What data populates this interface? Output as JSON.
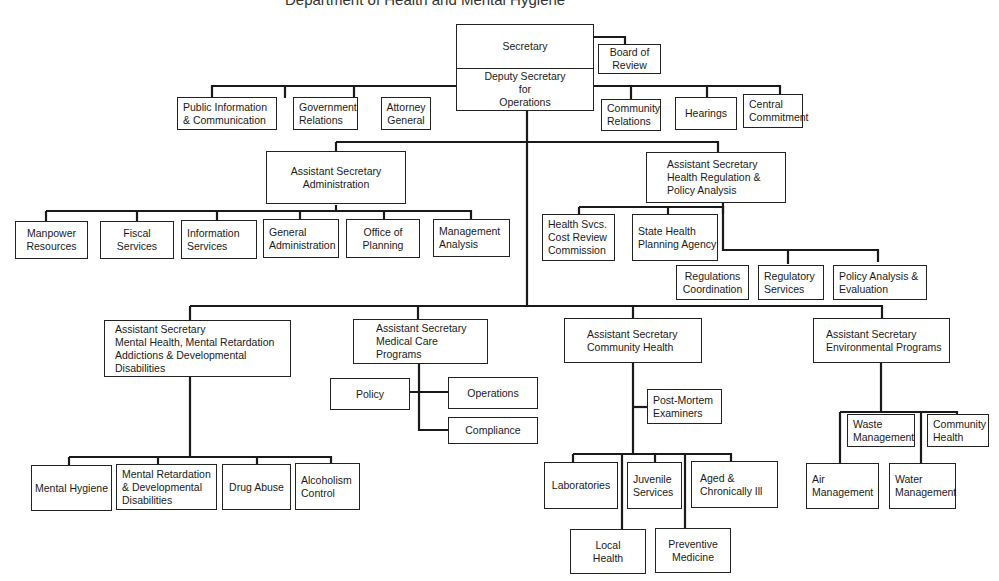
{
  "diagram": {
    "type": "org-chart",
    "top": {
      "secretary": "Secretary",
      "deputy": [
        "Deputy Secretary",
        "for",
        "Operations"
      ],
      "board_of_review": [
        "Board of",
        "Review"
      ]
    },
    "staff_left": [
      [
        "Public Information",
        "& Communication"
      ],
      [
        "Government",
        "Relations"
      ],
      [
        "Attorney",
        "General"
      ]
    ],
    "staff_right": [
      [
        "Community",
        "Relations"
      ],
      [
        "Hearings"
      ],
      [
        "Central",
        "Commitment"
      ]
    ],
    "administration": {
      "head": [
        "Assistant Secretary",
        "Administration"
      ],
      "units": [
        [
          "Manpower",
          "Resources"
        ],
        [
          "Fiscal",
          "Services"
        ],
        [
          "Information",
          "Services"
        ],
        [
          "General",
          "Administration"
        ],
        [
          "Office of",
          "Planning"
        ],
        [
          "Management",
          "Analysis"
        ]
      ]
    },
    "health_regulation": {
      "head": [
        "Assistant Secretary",
        "Health Regulation &",
        "Policy Analysis"
      ],
      "upper_units": [
        [
          "Health Svcs.",
          "Cost Review",
          "Commission"
        ],
        [
          "State Health",
          "Planning Agency"
        ]
      ],
      "lower_units": [
        [
          "Regulations",
          "Coordination"
        ],
        [
          "Regulatory",
          "Services"
        ],
        [
          "Policy Analysis &",
          "Evaluation"
        ]
      ]
    },
    "mental_health": {
      "head": [
        "Assistant Secretary",
        "Mental Health, Mental Retardation",
        "Addictions & Developmental",
        "Disabilities"
      ],
      "units": [
        [
          "Mental Hygiene"
        ],
        [
          "Mental Retardation",
          "& Developmental",
          "Disabilities"
        ],
        [
          "Drug Abuse"
        ],
        [
          "Alcoholism",
          "Control"
        ]
      ]
    },
    "medical_care": {
      "head": [
        "Assistant Secretary",
        "Medical Care",
        "Programs"
      ],
      "units": [
        [
          "Policy"
        ],
        [
          "Operations"
        ],
        [
          "Compliance"
        ]
      ]
    },
    "community_health": {
      "head": [
        "Assistant Secretary",
        "Community Health"
      ],
      "side_unit": [
        "Post-Mortem",
        "Examiners"
      ],
      "units_row1": [
        [
          "Laboratories"
        ],
        [
          "Juvenile",
          "Services"
        ],
        [
          "Aged &",
          "Chronically Ill"
        ]
      ],
      "units_row2": [
        [
          "Local",
          "Health"
        ],
        [
          "Preventive",
          "Medicine"
        ]
      ]
    },
    "environmental": {
      "head": [
        "Assistant Secretary",
        "Environmental Programs"
      ],
      "units_row1": [
        [
          "Waste",
          "Management"
        ],
        [
          "Community",
          "Health"
        ]
      ],
      "units_row2": [
        [
          "Air",
          "Management"
        ],
        [
          "Water",
          "Management"
        ]
      ]
    }
  }
}
